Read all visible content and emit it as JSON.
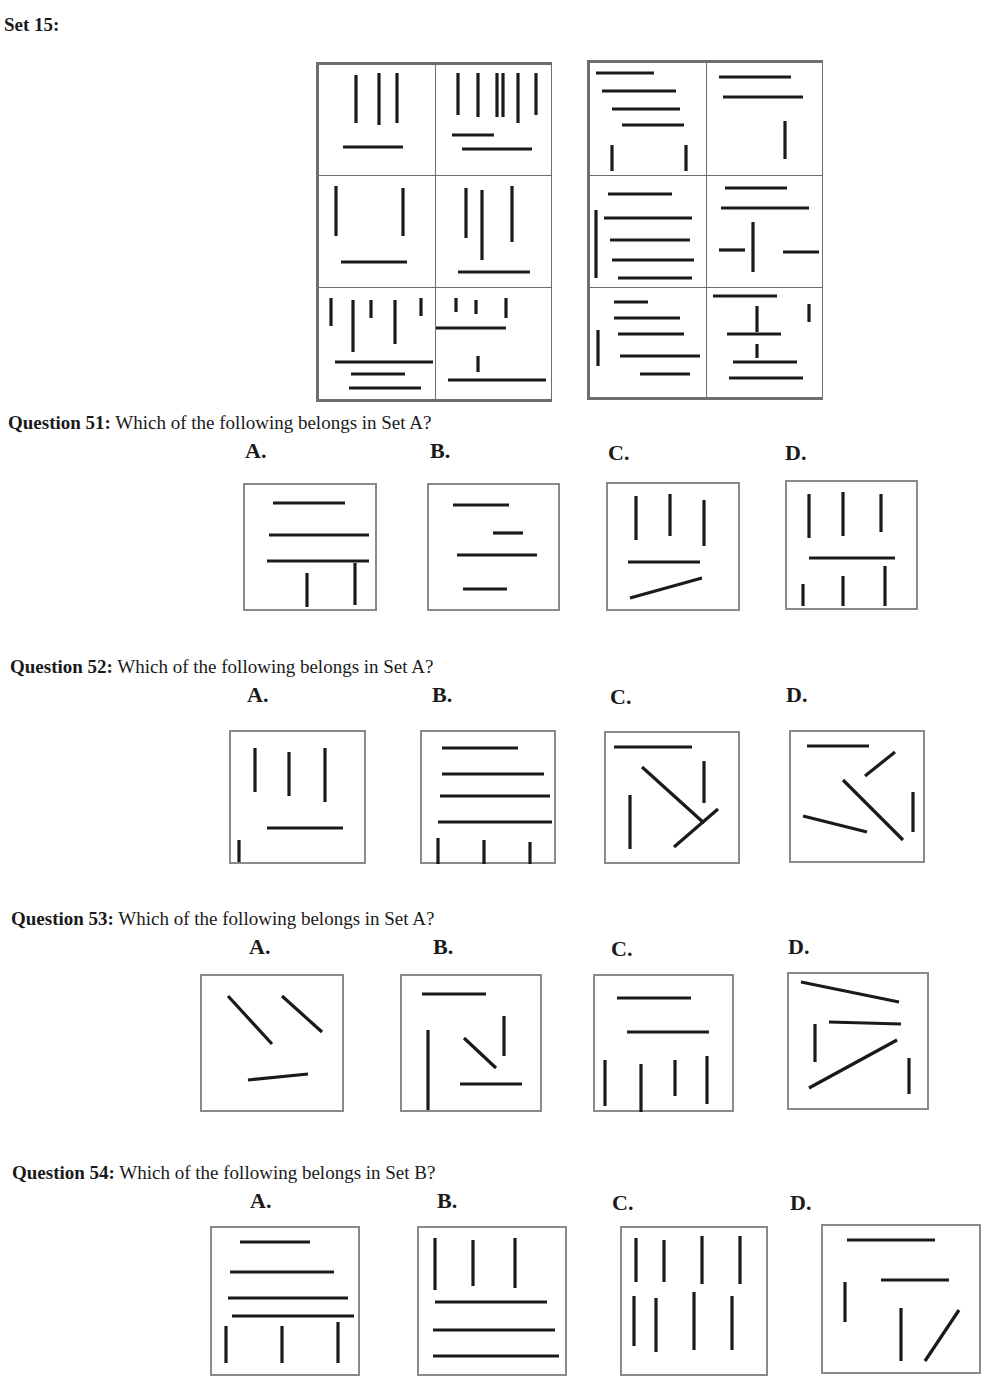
{
  "title": "Set 15:",
  "stroke_color": "#1a1a1a",
  "border_color": "#8a8a8a",
  "setA": {
    "cells": [
      {
        "lines": [
          [
            37,
            10,
            37,
            58
          ],
          [
            60,
            8,
            60,
            60
          ],
          [
            78,
            8,
            78,
            58
          ],
          [
            24,
            82,
            84,
            82
          ]
        ]
      },
      {
        "lines": [
          [
            22,
            8,
            22,
            50
          ],
          [
            42,
            8,
            42,
            52
          ],
          [
            61,
            8,
            61,
            52
          ],
          [
            67,
            8,
            67,
            52
          ],
          [
            82,
            8,
            82,
            58
          ],
          [
            100,
            8,
            100,
            50
          ],
          [
            16,
            70,
            58,
            70
          ],
          [
            26,
            84,
            96,
            84
          ]
        ]
      },
      {
        "lines": [
          [
            17,
            10,
            17,
            60
          ],
          [
            84,
            12,
            84,
            60
          ],
          [
            22,
            86,
            88,
            86
          ]
        ]
      },
      {
        "lines": [
          [
            30,
            12,
            30,
            62
          ],
          [
            46,
            14,
            46,
            84
          ],
          [
            76,
            10,
            76,
            66
          ],
          [
            22,
            96,
            94,
            96
          ]
        ]
      },
      {
        "lines": [
          [
            12,
            10,
            12,
            38
          ],
          [
            34,
            12,
            34,
            64
          ],
          [
            52,
            12,
            52,
            30
          ],
          [
            76,
            12,
            76,
            56
          ],
          [
            102,
            10,
            102,
            28
          ],
          [
            16,
            74,
            114,
            74
          ],
          [
            32,
            86,
            86,
            86
          ],
          [
            30,
            100,
            102,
            100
          ]
        ]
      },
      {
        "lines": [
          [
            20,
            10,
            20,
            24
          ],
          [
            40,
            12,
            40,
            26
          ],
          [
            70,
            10,
            70,
            30
          ],
          [
            0,
            40,
            70,
            40
          ],
          [
            42,
            68,
            42,
            84
          ],
          [
            12,
            92,
            110,
            92
          ]
        ]
      }
    ]
  },
  "setB": {
    "cells": [
      {
        "lines": [
          [
            6,
            10,
            64,
            10
          ],
          [
            12,
            28,
            86,
            28
          ],
          [
            22,
            46,
            90,
            46
          ],
          [
            32,
            62,
            94,
            62
          ],
          [
            22,
            82,
            22,
            108
          ],
          [
            96,
            82,
            96,
            108
          ]
        ]
      },
      {
        "lines": [
          [
            12,
            14,
            84,
            14
          ],
          [
            16,
            34,
            96,
            34
          ],
          [
            78,
            58,
            78,
            96
          ]
        ]
      },
      {
        "lines": [
          [
            18,
            18,
            82,
            18
          ],
          [
            14,
            42,
            102,
            42
          ],
          [
            6,
            34,
            6,
            102
          ],
          [
            20,
            64,
            100,
            64
          ],
          [
            22,
            84,
            104,
            84
          ],
          [
            28,
            102,
            102,
            102
          ]
        ]
      },
      {
        "lines": [
          [
            18,
            12,
            80,
            12
          ],
          [
            14,
            32,
            102,
            32
          ],
          [
            46,
            46,
            46,
            96
          ],
          [
            12,
            74,
            38,
            74
          ],
          [
            76,
            76,
            112,
            76
          ]
        ]
      },
      {
        "lines": [
          [
            24,
            14,
            58,
            14
          ],
          [
            24,
            30,
            90,
            30
          ],
          [
            8,
            42,
            8,
            78
          ],
          [
            28,
            46,
            94,
            46
          ],
          [
            30,
            68,
            110,
            68
          ],
          [
            50,
            86,
            100,
            86
          ]
        ]
      },
      {
        "lines": [
          [
            6,
            8,
            70,
            8
          ],
          [
            50,
            18,
            50,
            44
          ],
          [
            102,
            16,
            102,
            34
          ],
          [
            20,
            46,
            74,
            46
          ],
          [
            50,
            56,
            50,
            70
          ],
          [
            26,
            74,
            90,
            74
          ],
          [
            22,
            90,
            96,
            90
          ]
        ]
      }
    ]
  },
  "questions": [
    {
      "label": "Question 51:",
      "text": " Which of the following belongs in Set A?",
      "options": [
        {
          "letter": "A.",
          "lines": [
            [
              28,
              18,
              100,
              18
            ],
            [
              24,
              50,
              124,
              50
            ],
            [
              22,
              76,
              124,
              76
            ],
            [
              62,
              88,
              62,
              122
            ],
            [
              110,
              78,
              110,
              120
            ]
          ]
        },
        {
          "letter": "B.",
          "lines": [
            [
              24,
              20,
              80,
              20
            ],
            [
              64,
              48,
              94,
              48
            ],
            [
              28,
              70,
              108,
              70
            ],
            [
              34,
              104,
              78,
              104
            ]
          ]
        },
        {
          "letter": "C.",
          "lines": [
            [
              28,
              12,
              28,
              56
            ],
            [
              62,
              10,
              62,
              52
            ],
            [
              96,
              16,
              96,
              62
            ],
            [
              20,
              78,
              92,
              78
            ],
            [
              22,
              114,
              94,
              94
            ]
          ]
        },
        {
          "letter": "D.",
          "lines": [
            [
              22,
              12,
              22,
              56
            ],
            [
              56,
              10,
              56,
              54
            ],
            [
              94,
              12,
              94,
              50
            ],
            [
              22,
              76,
              108,
              76
            ],
            [
              16,
              102,
              16,
              124
            ],
            [
              56,
              94,
              56,
              124
            ],
            [
              98,
              84,
              98,
              124
            ]
          ]
        }
      ]
    },
    {
      "label": "Question 52:",
      "text": " Which of the following belongs in Set A?",
      "options": [
        {
          "letter": "A.",
          "lines": [
            [
              24,
              16,
              24,
              60
            ],
            [
              58,
              20,
              58,
              64
            ],
            [
              94,
              16,
              94,
              70
            ],
            [
              36,
              96,
              112,
              96
            ],
            [
              8,
              108,
              8,
              130
            ]
          ]
        },
        {
          "letter": "B.",
          "lines": [
            [
              20,
              16,
              96,
              16
            ],
            [
              20,
              42,
              122,
              42
            ],
            [
              18,
              64,
              128,
              64
            ],
            [
              16,
              90,
              130,
              90
            ],
            [
              16,
              106,
              16,
              132
            ],
            [
              62,
              108,
              62,
              132
            ],
            [
              108,
              110,
              108,
              132
            ]
          ]
        },
        {
          "letter": "C.",
          "lines": [
            [
              8,
              14,
              86,
              14
            ],
            [
              36,
              34,
              98,
              90
            ],
            [
              98,
              28,
              98,
              70
            ],
            [
              24,
              62,
              24,
              116
            ],
            [
              68,
              114,
              112,
              76
            ]
          ]
        },
        {
          "letter": "D.",
          "lines": [
            [
              16,
              14,
              78,
              14
            ],
            [
              74,
              44,
              104,
              20
            ],
            [
              52,
              48,
              112,
              108
            ],
            [
              122,
              60,
              122,
              100
            ],
            [
              12,
              84,
              76,
              100
            ]
          ]
        }
      ]
    },
    {
      "label": "Question 53:",
      "text": " Which of the following belongs in Set A?",
      "options": [
        {
          "letter": "A.",
          "lines": [
            [
              26,
              20,
              70,
              68
            ],
            [
              80,
              20,
              120,
              56
            ],
            [
              46,
              104,
              106,
              98
            ]
          ]
        },
        {
          "letter": "B.",
          "lines": [
            [
              20,
              18,
              84,
              18
            ],
            [
              102,
              40,
              102,
              80
            ],
            [
              26,
              54,
              26,
              134
            ],
            [
              62,
              62,
              94,
              92
            ],
            [
              58,
              108,
              120,
              108
            ]
          ]
        },
        {
          "letter": "C.",
          "lines": [
            [
              22,
              22,
              96,
              22
            ],
            [
              32,
              56,
              114,
              56
            ],
            [
              10,
              84,
              10,
              130
            ],
            [
              46,
              88,
              46,
              136
            ],
            [
              80,
              84,
              80,
              120
            ],
            [
              112,
              80,
              112,
              128
            ]
          ]
        },
        {
          "letter": "D.",
          "lines": [
            [
              12,
              8,
              110,
              28
            ],
            [
              26,
              50,
              26,
              88
            ],
            [
              40,
              48,
              112,
              50
            ],
            [
              20,
              114,
              108,
              66
            ],
            [
              120,
              84,
              120,
              120
            ]
          ]
        }
      ]
    },
    {
      "label": "Question 54:",
      "text": " Which of the following belongs in Set B?",
      "options": [
        {
          "letter": "A.",
          "lines": [
            [
              28,
              14,
              98,
              14
            ],
            [
              18,
              44,
              122,
              44
            ],
            [
              16,
              70,
              136,
              70
            ],
            [
              20,
              88,
              142,
              88
            ],
            [
              14,
              98,
              14,
              135
            ],
            [
              70,
              98,
              70,
              135
            ],
            [
              126,
              94,
              126,
              135
            ]
          ]
        },
        {
          "letter": "B.",
          "lines": [
            [
              16,
              10,
              16,
              62
            ],
            [
              54,
              12,
              54,
              58
            ],
            [
              96,
              10,
              96,
              60
            ],
            [
              16,
              74,
              128,
              74
            ],
            [
              14,
              102,
              136,
              102
            ],
            [
              14,
              128,
              140,
              128
            ]
          ]
        },
        {
          "letter": "C.",
          "lines": [
            [
              14,
              10,
              14,
              54
            ],
            [
              42,
              12,
              42,
              54
            ],
            [
              80,
              8,
              80,
              56
            ],
            [
              118,
              8,
              118,
              56
            ],
            [
              12,
              68,
              12,
              118
            ],
            [
              34,
              70,
              34,
              124
            ],
            [
              72,
              64,
              72,
              122
            ],
            [
              110,
              68,
              110,
              122
            ]
          ]
        },
        {
          "letter": "D.",
          "lines": [
            [
              24,
              14,
              112,
              14
            ],
            [
              58,
              54,
              126,
              54
            ],
            [
              22,
              56,
              22,
              96
            ],
            [
              78,
              82,
              78,
              135
            ],
            [
              102,
              135,
              136,
              84
            ]
          ]
        }
      ]
    }
  ]
}
